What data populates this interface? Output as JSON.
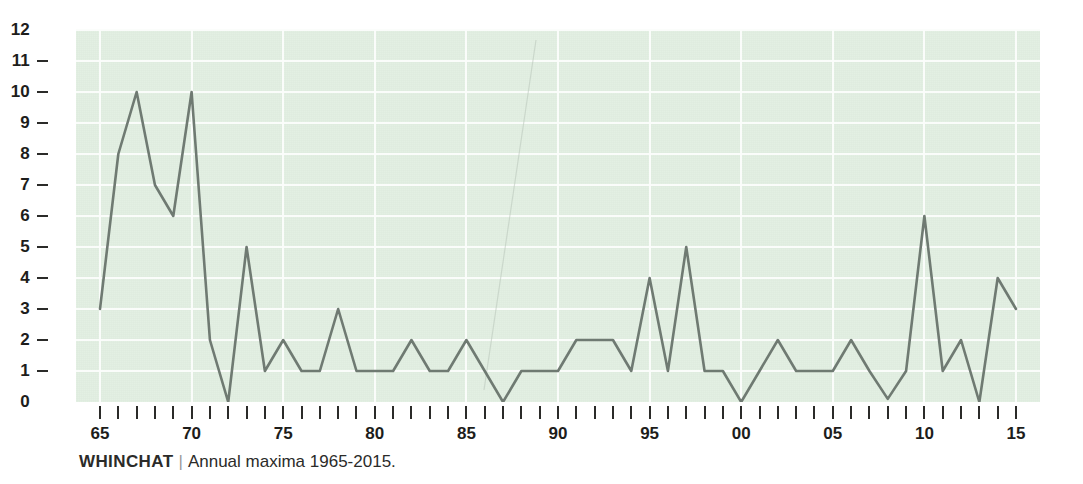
{
  "caption": {
    "species": "WHINCHAT",
    "separator": "|",
    "description": "Annual maxima 1965-2015."
  },
  "colors": {
    "plot_background": "#e2efe2",
    "gridline": "#fbfdfb",
    "line": "#6f7a72",
    "axis_text": "#1d1d1b",
    "tick_mark": "#2b2b29",
    "page_background": "#ffffff"
  },
  "chart_data": {
    "type": "line",
    "xlabel": "",
    "ylabel": "",
    "xlim": [
      1965,
      2015
    ],
    "ylim": [
      0,
      12
    ],
    "grid": true,
    "legend": null,
    "y_ticks": [
      0,
      1,
      2,
      3,
      4,
      5,
      6,
      7,
      8,
      9,
      10,
      11,
      12
    ],
    "y_tick_labels": [
      "0",
      "1",
      "2",
      "3",
      "4",
      "5",
      "6",
      "7",
      "8",
      "9",
      "10",
      "11",
      "12"
    ],
    "x_tick_labels": [
      "65",
      "70",
      "75",
      "80",
      "85",
      "90",
      "95",
      "00",
      "05",
      "10",
      "15"
    ],
    "x_tick_years": [
      1965,
      1970,
      1975,
      1980,
      1985,
      1990,
      1995,
      2000,
      2005,
      2010,
      2015
    ],
    "x_minor_tick_years": [
      1965,
      1966,
      1967,
      1968,
      1969,
      1970,
      1971,
      1972,
      1973,
      1974,
      1975,
      1976,
      1977,
      1978,
      1979,
      1980,
      1981,
      1982,
      1983,
      1984,
      1985,
      1986,
      1987,
      1988,
      1989,
      1990,
      1991,
      1992,
      1993,
      1994,
      1995,
      1996,
      1997,
      1998,
      1999,
      2000,
      2001,
      2002,
      2003,
      2004,
      2005,
      2006,
      2007,
      2008,
      2009,
      2010,
      2011,
      2012,
      2013,
      2014,
      2015
    ],
    "series": [
      {
        "name": "Annual maxima",
        "x": [
          1965,
          1966,
          1967,
          1968,
          1969,
          1970,
          1971,
          1972,
          1973,
          1974,
          1975,
          1976,
          1977,
          1978,
          1979,
          1980,
          1981,
          1982,
          1983,
          1984,
          1985,
          1986,
          1987,
          1988,
          1989,
          1990,
          1991,
          1992,
          1993,
          1994,
          1995,
          1996,
          1997,
          1998,
          1999,
          2000,
          2001,
          2002,
          2003,
          2004,
          2005,
          2006,
          2007,
          2008,
          2009,
          2010,
          2011,
          2012,
          2013,
          2014,
          2015
        ],
        "values": [
          3,
          8,
          10,
          7,
          6,
          10,
          2,
          0,
          5,
          1,
          2,
          1,
          1,
          3,
          1,
          1,
          1,
          2,
          1,
          1,
          2,
          1,
          0,
          1,
          1,
          1,
          2,
          2,
          2,
          1,
          4,
          1,
          5,
          1,
          1,
          0,
          1,
          2,
          1,
          1,
          1,
          2,
          1,
          0.1,
          1,
          6,
          1,
          2,
          0,
          4,
          3
        ]
      }
    ]
  }
}
